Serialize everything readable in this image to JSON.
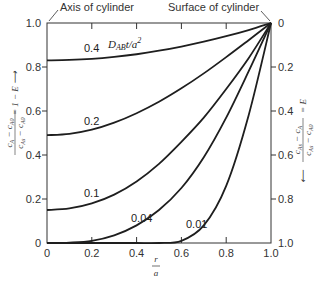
{
  "chart_data": {
    "type": "line",
    "title": "",
    "xlabel": "r/a",
    "ylabel_left": "(cA − cA0)/(cAs − cA0) = 1 − E",
    "ylabel_right": "(cAs − cA)/(cAs − cA0) = E",
    "xlim": [
      0,
      1.0
    ],
    "ylim_left": [
      0,
      1.0
    ],
    "ylim_right": [
      1.0,
      0
    ],
    "x_ticks": [
      "0",
      "0.2",
      "0.4",
      "0.6",
      "0.8",
      "1.0"
    ],
    "y_ticks_left": [
      "0",
      "0.2",
      "0.4",
      "0.6",
      "0.8",
      "1.0"
    ],
    "y_ticks_right": [
      "1.0",
      "0.8",
      "0.6",
      "0.4",
      "0.2",
      "0"
    ],
    "grid": false,
    "annotations": {
      "axis_of_cylinder": "Axis of cylinder",
      "surface_of_cylinder": "Surface of cylinder",
      "parameter_label": "DABt/a²"
    },
    "x": [
      0,
      0.1,
      0.2,
      0.3,
      0.4,
      0.5,
      0.6,
      0.7,
      0.8,
      0.9,
      1.0
    ],
    "series": [
      {
        "name": "0.4",
        "values": [
          0.83,
          0.832,
          0.837,
          0.846,
          0.858,
          0.874,
          0.893,
          0.915,
          0.94,
          0.968,
          1.0
        ]
      },
      {
        "name": "0.2",
        "values": [
          0.49,
          0.496,
          0.515,
          0.547,
          0.59,
          0.642,
          0.703,
          0.771,
          0.845,
          0.922,
          1.0
        ]
      },
      {
        "name": "0.1",
        "values": [
          0.15,
          0.157,
          0.18,
          0.22,
          0.28,
          0.36,
          0.46,
          0.57,
          0.7,
          0.84,
          1.0
        ]
      },
      {
        "name": "0.04",
        "values": [
          0.0,
          0.002,
          0.01,
          0.035,
          0.08,
          0.15,
          0.25,
          0.39,
          0.57,
          0.78,
          1.0
        ]
      },
      {
        "name": "0.01",
        "values": [
          0.0,
          0.0,
          0.0,
          0.0,
          0.0,
          0.0,
          0.01,
          0.08,
          0.26,
          0.58,
          1.0
        ]
      }
    ],
    "curve_labels": [
      "0.4",
      "0.2",
      "0.1",
      "0.04",
      "0.01"
    ]
  }
}
